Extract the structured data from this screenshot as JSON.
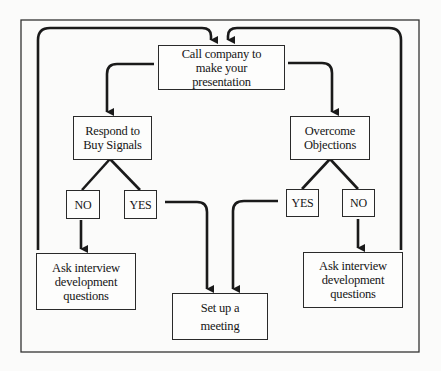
{
  "diagram": {
    "type": "flowchart",
    "nodes": {
      "call": {
        "label": "Call company to make your presentation"
      },
      "respond": {
        "label": "Respond to Buy Signals"
      },
      "overcome": {
        "label": "Overcome Objections"
      },
      "respond_no": {
        "label": "NO"
      },
      "respond_yes": {
        "label": "YES"
      },
      "overcome_yes": {
        "label": "YES"
      },
      "overcome_no": {
        "label": "NO"
      },
      "ask_left": {
        "label": "Ask interview development questions"
      },
      "ask_right": {
        "label": "Ask interview development questions"
      },
      "meeting": {
        "label": "Set up a meeting"
      }
    },
    "edges": [
      {
        "from": "call",
        "to": "respond"
      },
      {
        "from": "call",
        "to": "overcome"
      },
      {
        "from": "respond",
        "to": "respond_no"
      },
      {
        "from": "respond",
        "to": "respond_yes"
      },
      {
        "from": "overcome",
        "to": "overcome_yes"
      },
      {
        "from": "overcome",
        "to": "overcome_no"
      },
      {
        "from": "respond_no",
        "to": "ask_left"
      },
      {
        "from": "overcome_no",
        "to": "ask_right"
      },
      {
        "from": "respond_yes",
        "to": "meeting"
      },
      {
        "from": "overcome_yes",
        "to": "meeting"
      },
      {
        "from": "ask_left",
        "to": "call"
      },
      {
        "from": "ask_right",
        "to": "call"
      }
    ],
    "colors": {
      "line": "#1a1a1a",
      "border": "#2a2a2a",
      "background": "#fbfbfa"
    }
  }
}
